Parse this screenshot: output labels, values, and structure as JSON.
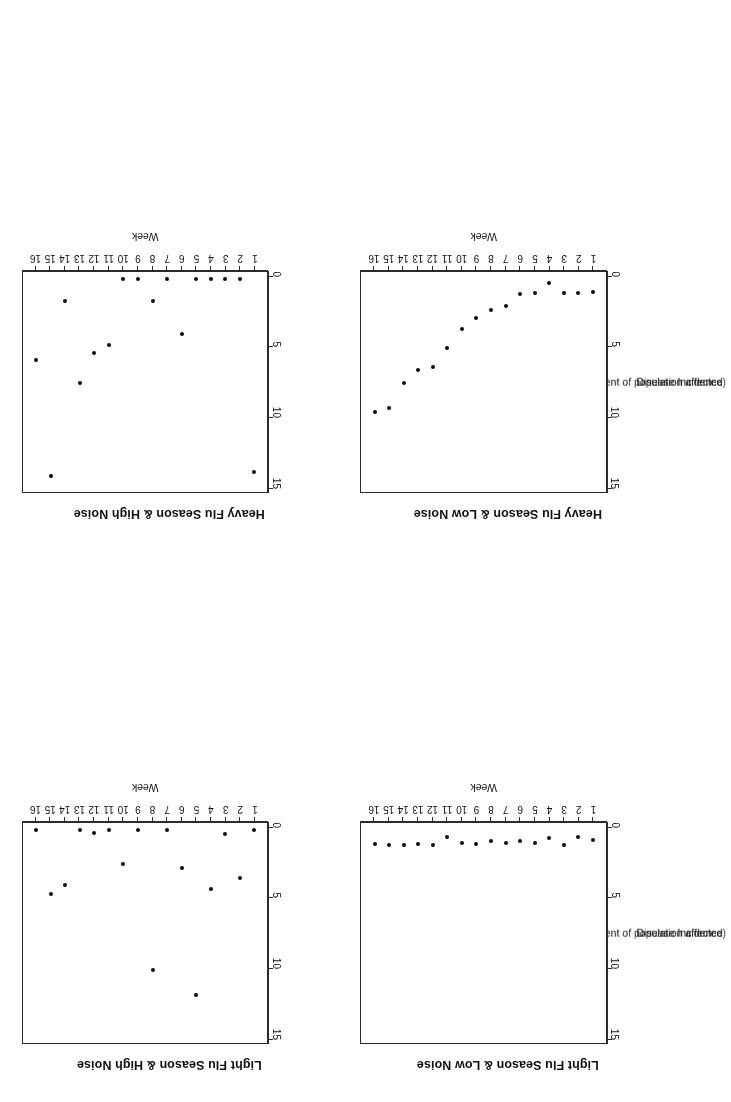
{
  "figure": {
    "layout": "2x2 grid of scatter panels",
    "axis_color": "#2b2b2b",
    "point_color": "#0c0c0c",
    "background": "#ffffff"
  },
  "axis_titles": {
    "x": "Week",
    "y_line1": "Disease Incidence",
    "y_line2": "(percent of population affected)"
  },
  "y_ticks": [
    "0",
    "5",
    "10",
    "15"
  ],
  "x_ticks": [
    "1",
    "2",
    "3",
    "4",
    "5",
    "6",
    "7",
    "8",
    "9",
    "10",
    "11",
    "12",
    "13",
    "14",
    "15",
    "16"
  ],
  "panels": [
    {
      "title": "Light Flu Season & Low Noise",
      "key": "light_low"
    },
    {
      "title": "Light Flu Season & High Noise",
      "key": "light_high"
    },
    {
      "title": "Heavy Flu Season & Low Noise",
      "key": "heavy_low"
    },
    {
      "title": "Heavy Flu Season & High Noise",
      "key": "heavy_high"
    }
  ],
  "chart_data": [
    {
      "type": "scatter",
      "title": "Light Flu Season & Low Noise",
      "xlabel": "Week",
      "ylabel": "Disease Incidence (percent of population affected)",
      "xlim": [
        1,
        16
      ],
      "ylim": [
        0,
        15
      ],
      "xticks": [
        1,
        2,
        3,
        4,
        5,
        6,
        7,
        8,
        9,
        10,
        11,
        12,
        13,
        14,
        15,
        16
      ],
      "yticks": [
        0,
        5,
        10,
        15
      ],
      "grid": false,
      "legend": null,
      "x": [
        1,
        2,
        3,
        4,
        5,
        6,
        7,
        8,
        9,
        10,
        11,
        12,
        13,
        14,
        15,
        16
      ],
      "values": [
        0.8,
        0.6,
        1.2,
        0.7,
        1.0,
        0.9,
        1.0,
        0.9,
        1.1,
        1.0,
        0.6,
        1.2,
        1.1,
        1.2,
        1.2,
        1.1
      ]
    },
    {
      "type": "scatter",
      "title": "Light Flu Season & High Noise",
      "xlabel": "Week",
      "ylabel": "Disease Incidence (percent of population affected)",
      "xlim": [
        1,
        16
      ],
      "ylim": [
        0,
        15
      ],
      "xticks": [
        1,
        2,
        3,
        4,
        5,
        6,
        7,
        8,
        9,
        10,
        11,
        12,
        13,
        14,
        15,
        16
      ],
      "yticks": [
        0,
        5,
        10,
        15
      ],
      "grid": false,
      "legend": null,
      "x": [
        1,
        2,
        3,
        4,
        5,
        6,
        7,
        8,
        9,
        10,
        11,
        12,
        13,
        14,
        15,
        16
      ],
      "values": [
        0.1,
        3.5,
        0.4,
        4.3,
        11.9,
        2.8,
        0.1,
        10.1,
        0.1,
        2.5,
        0.1,
        0.3,
        0.1,
        4.0,
        4.7,
        0.1
      ]
    },
    {
      "type": "scatter",
      "title": "Heavy Flu Season & Low Noise",
      "xlabel": "Week",
      "ylabel": "Disease Incidence (percent of population affected)",
      "xlim": [
        1,
        16
      ],
      "ylim": [
        0,
        15
      ],
      "xticks": [
        1,
        2,
        3,
        4,
        5,
        6,
        7,
        8,
        9,
        10,
        11,
        12,
        13,
        14,
        15,
        16
      ],
      "yticks": [
        0,
        5,
        10,
        15
      ],
      "grid": false,
      "legend": null,
      "x": [
        1,
        2,
        3,
        4,
        5,
        6,
        7,
        8,
        9,
        10,
        11,
        12,
        13,
        14,
        15,
        16
      ],
      "values": [
        1.0,
        1.1,
        1.1,
        0.4,
        1.1,
        1.2,
        2.0,
        2.3,
        2.9,
        3.7,
        5.0,
        6.4,
        6.6,
        7.5,
        9.3,
        9.6
      ]
    },
    {
      "type": "scatter",
      "title": "Heavy Flu Season & High Noise",
      "xlabel": "Week",
      "ylabel": "Disease Incidence (percent of population affected)",
      "xlim": [
        1,
        16
      ],
      "ylim": [
        0,
        15
      ],
      "xticks": [
        1,
        2,
        3,
        4,
        5,
        6,
        7,
        8,
        9,
        10,
        11,
        12,
        13,
        14,
        15,
        16
      ],
      "yticks": [
        0,
        5,
        10,
        15
      ],
      "grid": false,
      "legend": null,
      "x": [
        1,
        2,
        3,
        4,
        5,
        6,
        7,
        8,
        9,
        10,
        11,
        12,
        13,
        14,
        15,
        16
      ],
      "values": [
        13.9,
        0.1,
        0.1,
        0.1,
        0.1,
        4.0,
        0.1,
        1.7,
        0.1,
        0.1,
        4.8,
        5.4,
        7.5,
        1.7,
        14.2,
        5.9
      ]
    }
  ]
}
